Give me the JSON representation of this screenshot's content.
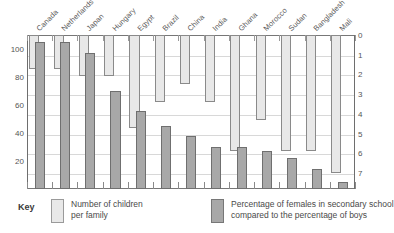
{
  "key": {
    "title": "Key",
    "light_label_line1": "Number of children",
    "light_label_line2": "per family",
    "dark_label_line1": "Percentage of females in secondary school",
    "dark_label_line2": "compared to the percentage of boys",
    "light_color": "#e8e8e8",
    "dark_color": "#a8a8a8"
  },
  "axes": {
    "left_ticks": [
      "20",
      "40",
      "60",
      "80",
      "100"
    ],
    "right_ticks": [
      "0",
      "1",
      "2",
      "3",
      "4",
      "5",
      "6",
      "7"
    ]
  },
  "chart_data": {
    "type": "bar",
    "title": "",
    "xlabel": "",
    "ylabel": "",
    "grid": true,
    "legend_position": "bottom",
    "categories": [
      "Canada",
      "Netherlands",
      "Japan",
      "Hungary",
      "Egypt",
      "Brazil",
      "China",
      "India",
      "Ghana",
      "Morocco",
      "Sudan",
      "Bangladesh",
      "Mali"
    ],
    "series": [
      {
        "name": "Number of children per family",
        "axis": "right",
        "ylim": [
          0,
          7.8
        ],
        "inverted": true,
        "color": "#e8e8e8",
        "values": [
          1.7,
          1.7,
          2.1,
          2.1,
          4.7,
          3.4,
          2.5,
          3.4,
          5.9,
          4.3,
          5.9,
          5.9,
          7.0
        ]
      },
      {
        "name": "Percentage of females in secondary school compared to the percentage of boys",
        "axis": "left",
        "ylim": [
          0,
          110
        ],
        "color": "#a8a8a8",
        "values": [
          105,
          105,
          97,
          70,
          56,
          45,
          38,
          30,
          30,
          27,
          22,
          14,
          5
        ]
      }
    ]
  }
}
